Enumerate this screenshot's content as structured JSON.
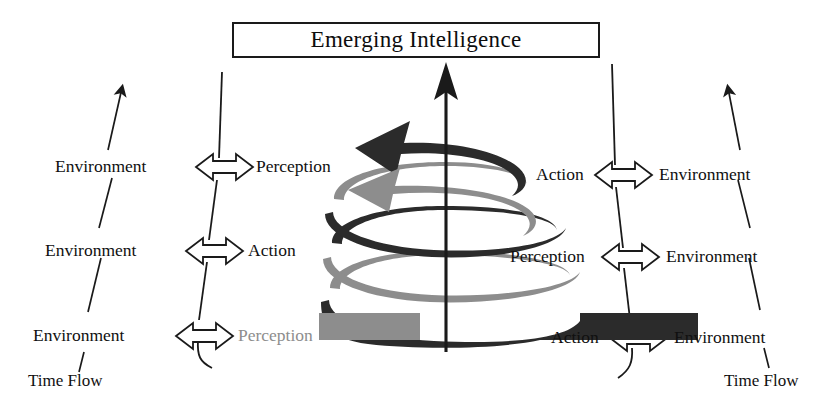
{
  "title": {
    "text": "Emerging Intelligence"
  },
  "colors": {
    "ribbon_dark": "#2b2b2b",
    "ribbon_light": "#8d8d8d",
    "line": "#1a1a1a",
    "faded_text": "#8d8d8d",
    "background": "#ffffff"
  },
  "left_column": {
    "rows": [
      {
        "left": "Environment",
        "arrow": "double-headed-arrow",
        "right": "Perception"
      },
      {
        "left": "Environment",
        "arrow": "double-headed-arrow",
        "right": "Action"
      },
      {
        "left": "Environment",
        "arrow": "double-headed-arrow",
        "right": "Perception"
      }
    ],
    "time_flow_label": "Time Flow"
  },
  "right_column": {
    "rows": [
      {
        "left": "Action",
        "arrow": "double-headed-arrow",
        "right": "Environment"
      },
      {
        "left": "Perception",
        "arrow": "double-headed-arrow",
        "right": "Environment"
      },
      {
        "left": "Action",
        "arrow": "double-headed-arrow",
        "right": "Environment"
      }
    ],
    "time_flow_label": "Time Flow"
  },
  "center": {
    "axis": "vertical-up-arrow",
    "spiral": "alternating-dark-light-helix"
  }
}
